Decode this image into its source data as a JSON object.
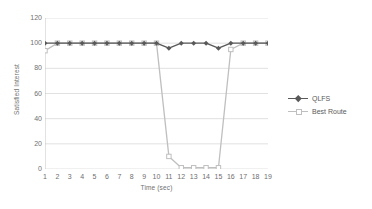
{
  "chart_data": {
    "type": "line",
    "title": "",
    "xlabel": "Time (sec)",
    "ylabel": "Satisfied Interest",
    "x": [
      1,
      2,
      3,
      4,
      5,
      6,
      7,
      8,
      9,
      10,
      11,
      12,
      13,
      14,
      15,
      16,
      17,
      18,
      19
    ],
    "xticklabels": [
      "1",
      "2",
      "3",
      "4",
      "5",
      "6",
      "7",
      "8",
      "9",
      "10",
      "11",
      "12",
      "13",
      "14",
      "15",
      "16",
      "17",
      "18",
      "19"
    ],
    "yticklabels": [
      "0",
      "20",
      "40",
      "60",
      "80",
      "100",
      "120"
    ],
    "yticks": [
      0,
      20,
      40,
      60,
      80,
      100,
      120
    ],
    "ylim": [
      0,
      120
    ],
    "xlim": [
      1,
      19
    ],
    "grid": "horizontal",
    "legend_position": "right",
    "series": [
      {
        "name": "QLFS",
        "color": "#595959",
        "marker": "diamond",
        "values": [
          100,
          100,
          100,
          100,
          100,
          100,
          100,
          100,
          100,
          100,
          96,
          100,
          100,
          100,
          96,
          100,
          100,
          100,
          100
        ]
      },
      {
        "name": "Best Route",
        "color": "#bfbfbf",
        "marker": "square",
        "values": [
          94,
          100,
          100,
          100,
          100,
          100,
          100,
          100,
          100,
          100,
          10,
          1,
          1,
          1,
          1,
          95,
          100,
          100,
          100
        ]
      }
    ]
  },
  "legend": {
    "items": [
      {
        "label": "QLFS"
      },
      {
        "label": "Best Route"
      }
    ]
  },
  "colors": {
    "qlfs": "#595959",
    "best_route": "#bfbfbf",
    "grid": "#d9d9d9",
    "axis": "#bfbfbf",
    "tick_text": "#6f6f6f"
  }
}
